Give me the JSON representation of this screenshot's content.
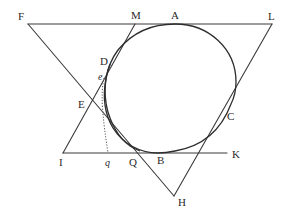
{
  "diagram": {
    "points": {
      "F": {
        "label": "F",
        "x": 28,
        "y": 24
      },
      "M": {
        "label": "M",
        "x": 135,
        "y": 24
      },
      "A": {
        "label": "A",
        "x": 175,
        "y": 24
      },
      "L": {
        "label": "L",
        "x": 272,
        "y": 24
      },
      "D": {
        "label": "D",
        "x": 110,
        "y": 64
      },
      "e": {
        "label": "e",
        "x": 104,
        "y": 78
      },
      "E": {
        "label": "E",
        "x": 97,
        "y": 103
      },
      "C": {
        "label": "C",
        "x": 232,
        "y": 95
      },
      "I": {
        "label": "I",
        "x": 63,
        "y": 153
      },
      "q": {
        "label": "q",
        "x": 108,
        "y": 153
      },
      "Q": {
        "label": "Q",
        "x": 133,
        "y": 153
      },
      "B": {
        "label": "B",
        "x": 162,
        "y": 153
      },
      "K": {
        "label": "K",
        "x": 227,
        "y": 153
      },
      "H": {
        "label": "H",
        "x": 174,
        "y": 196
      }
    },
    "labels": {
      "F": "F",
      "M": "M",
      "A": "A",
      "L": "L",
      "D": "D",
      "e": "e",
      "E": "E",
      "C": "C",
      "I": "I",
      "q": "q",
      "Q": "Q",
      "B": "B",
      "K": "K",
      "H": "H"
    },
    "segments": [
      {
        "from": "F",
        "to": "L",
        "kind": "solid"
      },
      {
        "from": "F",
        "to": "H",
        "kind": "solid"
      },
      {
        "from": "L",
        "to": "H",
        "kind": "solid"
      },
      {
        "from": "M",
        "to": "I",
        "kind": "solid"
      },
      {
        "from": "I",
        "to": "K",
        "kind": "solid"
      },
      {
        "from": "e",
        "to": "q",
        "kind": "dotted"
      }
    ],
    "curve": {
      "kind": "oval",
      "tangent_points": [
        "A",
        "D",
        "C",
        "B"
      ]
    },
    "colors": {
      "line": "#3a3a3a",
      "text": "#2a2a2a",
      "background": "#ffffff"
    }
  }
}
